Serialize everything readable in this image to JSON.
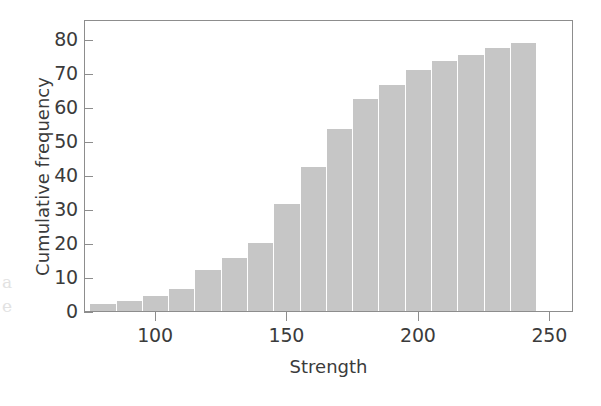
{
  "figure": {
    "background_color": "#ffffff",
    "frame_color": "#8d8d8d",
    "bar_color": "#c6c6c6",
    "text_color": "#3b3b3b"
  },
  "axes": {
    "x_title": "Strength",
    "y_title": "Cumulative frequency",
    "x_ticks": [
      "100",
      "150",
      "200",
      "250"
    ],
    "y_ticks": [
      "0",
      "10",
      "20",
      "30",
      "40",
      "50",
      "60",
      "70",
      "80"
    ]
  },
  "margin_notes": [
    "a",
    "e"
  ],
  "chart_data": {
    "type": "bar",
    "title": "",
    "subtitle": "",
    "xlabel": "Strength",
    "ylabel": "Cumulative frequency",
    "xlim": [
      73,
      259
    ],
    "ylim": [
      0,
      86
    ],
    "xtick_values": [
      100,
      150,
      200,
      250
    ],
    "ytick_values": [
      0,
      10,
      20,
      30,
      40,
      50,
      60,
      70,
      80
    ],
    "grid": false,
    "legend": null,
    "bin_width": 10,
    "bar_color": "#c6c6c6",
    "categories": [
      "75-85",
      "85-95",
      "95-105",
      "105-115",
      "115-125",
      "125-135",
      "135-145",
      "145-155",
      "155-165",
      "165-175",
      "175-185",
      "185-195",
      "195-205",
      "205-215",
      "215-225",
      "225-235",
      "235-245"
    ],
    "bin_left_edges": [
      75,
      85,
      95,
      105,
      115,
      125,
      135,
      145,
      155,
      165,
      175,
      185,
      195,
      205,
      215,
      225,
      235
    ],
    "bin_right_edges": [
      85,
      95,
      105,
      115,
      125,
      135,
      145,
      155,
      165,
      175,
      185,
      195,
      205,
      215,
      225,
      235,
      245
    ],
    "values": [
      2,
      3,
      4.5,
      6.5,
      12,
      15.5,
      20,
      31.5,
      42.5,
      53.5,
      62.5,
      66.5,
      71,
      73.5,
      75.5,
      77.5,
      79
    ],
    "annotations": []
  }
}
